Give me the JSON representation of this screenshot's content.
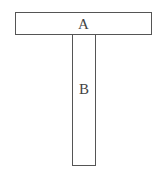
{
  "diagram": {
    "type": "T-shape composition",
    "shapes": [
      {
        "id": "A",
        "label": "A",
        "orientation": "horizontal",
        "position": "top"
      },
      {
        "id": "B",
        "label": "B",
        "orientation": "vertical",
        "position": "below A, centered"
      }
    ],
    "colors": {
      "stroke": "#555555",
      "fill": "#ffffff",
      "text": "#444444"
    }
  }
}
